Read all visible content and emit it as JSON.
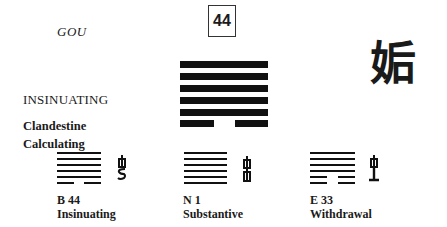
{
  "hexagram": {
    "number": "44",
    "pinyin": "GOU",
    "name": "INSINUATING",
    "keywords": [
      "Clandestine",
      "Calculating"
    ],
    "character": "姤",
    "lines_bottom_to_top": [
      "yin",
      "yang",
      "yang",
      "yang",
      "yang",
      "yang"
    ]
  },
  "related": [
    {
      "code": "B 44",
      "label": "Insinuating",
      "lines_bottom_to_top": [
        "yin",
        "yang",
        "yang",
        "yang",
        "yang",
        "yang"
      ],
      "glyph": "fire-glyph"
    },
    {
      "code": "N 1",
      "label": "Substantive",
      "lines_bottom_to_top": [
        "yang",
        "yang",
        "yang",
        "yang",
        "yang",
        "yang"
      ],
      "glyph": "double-tower-glyph"
    },
    {
      "code": "E 33",
      "label": "Withdrawal",
      "lines_bottom_to_top": [
        "yin",
        "yin",
        "yang",
        "yang",
        "yang",
        "yang"
      ],
      "glyph": "tower-base-glyph"
    }
  ]
}
